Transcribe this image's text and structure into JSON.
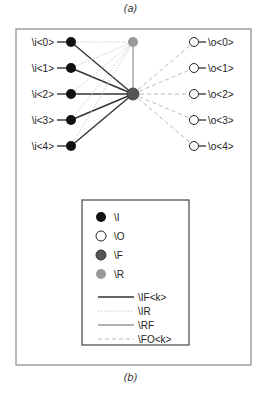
{
  "captions": {
    "top": "(a)",
    "bottom": "(b)"
  },
  "colors": {
    "input_node": "#111111",
    "output_node": "#ffffff",
    "f_node": "#555555",
    "r_node": "#999999",
    "edge_if": "#333333",
    "edge_ir": "#cccccc",
    "edge_rf": "#999999",
    "edge_fo": "#bbbbbb"
  },
  "diagram": {
    "inputs": [
      "\\i<0>",
      "\\i<1>",
      "\\i<2>",
      "\\i<3>",
      "\\i<4>"
    ],
    "outputs": [
      "\\o<0>",
      "\\o<1>",
      "\\o<2>",
      "\\o<3>",
      "\\o<4>"
    ]
  },
  "legend": {
    "nodes": [
      {
        "label": "\\I",
        "kind": "input"
      },
      {
        "label": "\\O",
        "kind": "output"
      },
      {
        "label": "\\F",
        "kind": "f"
      },
      {
        "label": "\\R",
        "kind": "r"
      }
    ],
    "edges": [
      {
        "label": "\\IF<k>",
        "kind": "if"
      },
      {
        "label": "\\IR",
        "kind": "ir"
      },
      {
        "label": "\\RF",
        "kind": "rf"
      },
      {
        "label": "\\FO<k>",
        "kind": "fo"
      }
    ]
  }
}
